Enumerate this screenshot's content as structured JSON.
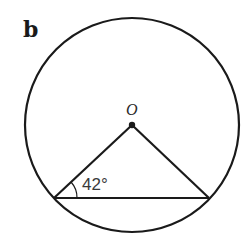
{
  "figure": {
    "panel_label": "b",
    "center_label": "O",
    "angle_label": "42°",
    "angle_degrees": 42,
    "colors": {
      "stroke": "#1a1a1a",
      "background": "#ffffff"
    },
    "geometry": {
      "circle": {
        "cx": 132,
        "cy": 125,
        "r": 107
      },
      "center_point": {
        "x": 132,
        "y": 125
      },
      "chord_left": {
        "x": 54,
        "y": 198
      },
      "chord_right": {
        "x": 209,
        "y": 198
      }
    }
  }
}
